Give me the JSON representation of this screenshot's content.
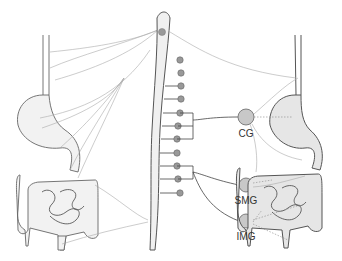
{
  "diagram": {
    "ganglia": [
      {
        "id": "cg",
        "label": "CG"
      },
      {
        "id": "smg",
        "label": "SMG"
      },
      {
        "id": "img",
        "label": "IMG"
      }
    ],
    "spinal_outflow_dots": 11,
    "colors": {
      "ganglion_fill": "#c8c8c8",
      "organ_fill": "#e6e6e6",
      "nerve_line": "#aaaaaa"
    }
  }
}
